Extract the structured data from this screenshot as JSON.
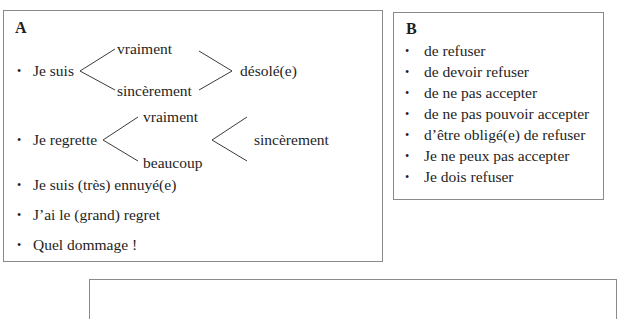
{
  "box_a": {
    "heading": "A",
    "row1": {
      "lead": "Je suis",
      "option_top": "vraiment",
      "option_bottom": "sincèrement",
      "tail": "désolé(e)"
    },
    "row2": {
      "lead": "Je regrette",
      "option_top": "vraiment",
      "option_bottom": "beaucoup",
      "tail": "sincèrement"
    },
    "items": [
      "Je suis (très) ennuyé(e)",
      "J’ai le (grand) regret",
      "Quel dommage !"
    ]
  },
  "box_b": {
    "heading": "B",
    "items": [
      "de refuser",
      "de devoir refuser",
      "de ne pas accepter",
      "de ne pas pouvoir accepter",
      "d’être obligé(e) de refuser",
      "Je ne peux pas accepter",
      "Je dois refuser"
    ]
  },
  "bullet_glyph": "•"
}
